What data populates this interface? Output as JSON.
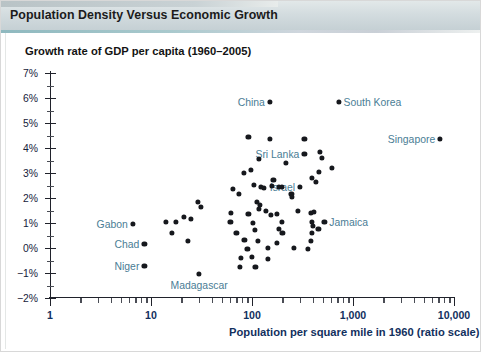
{
  "banner": {
    "title": "Population Density Versus Economic Growth"
  },
  "chart_data": {
    "type": "scatter",
    "title": "Population Density Versus Economic Growth",
    "xlabel": "Population per square mile in 1960 (ratio scale)",
    "ylabel": "Growth rate of GDP per capita (1960–2005)",
    "xscale": "log",
    "xlim": [
      1,
      10000
    ],
    "ylim": [
      -2,
      7
    ],
    "grid": false,
    "legend": null,
    "xticks": [
      {
        "value": 1,
        "label": "1"
      },
      {
        "value": 10,
        "label": "10"
      },
      {
        "value": 100,
        "label": "100"
      },
      {
        "value": 1000,
        "label": "1,000"
      },
      {
        "value": 10000,
        "label": "10,000"
      }
    ],
    "yticks": [
      {
        "value": 7,
        "label": "7%"
      },
      {
        "value": 6,
        "label": "6%"
      },
      {
        "value": 5,
        "label": "5%"
      },
      {
        "value": 4,
        "label": "4%"
      },
      {
        "value": 3,
        "label": "3%"
      },
      {
        "value": 2,
        "label": "2%"
      },
      {
        "value": 1,
        "label": "1%"
      },
      {
        "value": 0,
        "label": "0%"
      },
      {
        "value": -1,
        "label": "−1%"
      },
      {
        "value": -2,
        "label": "−2%"
      }
    ],
    "yminor": [
      6.5,
      5.5,
      4.5,
      3.5,
      2.5,
      1.5,
      0.5,
      -0.5,
      -1.5
    ],
    "points": [
      {
        "x": 150,
        "y": 5.85,
        "label": "China",
        "label_side": "left"
      },
      {
        "x": 720,
        "y": 5.85,
        "label": "South Korea",
        "label_side": "right"
      },
      {
        "x": 7300,
        "y": 4.35,
        "label": "Singapore",
        "label_side": "left"
      },
      {
        "x": 330,
        "y": 3.75,
        "label": "Sri Lanka",
        "label_side": "left"
      },
      {
        "x": 300,
        "y": 2.45,
        "label": "Israel",
        "label_side": "left"
      },
      {
        "x": 520,
        "y": 1.05,
        "label": "Jamaica",
        "label_side": "right"
      },
      {
        "x": 6.6,
        "y": 0.95,
        "label": "Gabon",
        "label_side": "left"
      },
      {
        "x": 8.6,
        "y": 0.17,
        "label": "Chad",
        "label_side": "left"
      },
      {
        "x": 8.6,
        "y": -0.72,
        "label": "Niger",
        "label_side": "left"
      },
      {
        "x": 30,
        "y": -1.05,
        "label": "Madagascar",
        "label_side": "below"
      },
      {
        "x": 92,
        "y": 4.45,
        "label": null
      },
      {
        "x": 150,
        "y": 4.35,
        "label": null
      },
      {
        "x": 330,
        "y": 4.35,
        "label": null
      },
      {
        "x": 470,
        "y": 3.85,
        "label": null
      },
      {
        "x": 490,
        "y": 3.62,
        "label": null
      },
      {
        "x": 118,
        "y": 3.55,
        "label": null
      },
      {
        "x": 218,
        "y": 3.42,
        "label": null
      },
      {
        "x": 620,
        "y": 3.22,
        "label": null
      },
      {
        "x": 98,
        "y": 3.12,
        "label": null
      },
      {
        "x": 83,
        "y": 3.02,
        "label": null
      },
      {
        "x": 460,
        "y": 3.05,
        "label": null
      },
      {
        "x": 390,
        "y": 2.82,
        "label": null
      },
      {
        "x": 163,
        "y": 2.72,
        "label": null
      },
      {
        "x": 430,
        "y": 2.65,
        "label": null
      },
      {
        "x": 105,
        "y": 2.52,
        "label": null
      },
      {
        "x": 122,
        "y": 2.45,
        "label": null
      },
      {
        "x": 132,
        "y": 2.42,
        "label": null
      },
      {
        "x": 158,
        "y": 2.48,
        "label": null
      },
      {
        "x": 186,
        "y": 2.45,
        "label": null
      },
      {
        "x": 196,
        "y": 2.45,
        "label": null
      },
      {
        "x": 65,
        "y": 2.35,
        "label": null
      },
      {
        "x": 74,
        "y": 2.18,
        "label": null
      },
      {
        "x": 246,
        "y": 2.18,
        "label": null
      },
      {
        "x": 250,
        "y": 2.05,
        "label": null
      },
      {
        "x": 29,
        "y": 1.85,
        "label": null
      },
      {
        "x": 31,
        "y": 1.65,
        "label": null
      },
      {
        "x": 112,
        "y": 1.85,
        "label": null
      },
      {
        "x": 120,
        "y": 1.72,
        "label": null
      },
      {
        "x": 116,
        "y": 1.58,
        "label": null
      },
      {
        "x": 138,
        "y": 1.48,
        "label": null
      },
      {
        "x": 62,
        "y": 1.42,
        "label": null
      },
      {
        "x": 92,
        "y": 1.35,
        "label": null
      },
      {
        "x": 154,
        "y": 1.32,
        "label": null
      },
      {
        "x": 176,
        "y": 1.35,
        "label": null
      },
      {
        "x": 286,
        "y": 1.48,
        "label": null
      },
      {
        "x": 380,
        "y": 1.42,
        "label": null
      },
      {
        "x": 410,
        "y": 1.45,
        "label": null
      },
      {
        "x": 14,
        "y": 1.05,
        "label": null
      },
      {
        "x": 17.5,
        "y": 1.05,
        "label": null
      },
      {
        "x": 21,
        "y": 1.25,
        "label": null
      },
      {
        "x": 25,
        "y": 1.15,
        "label": null
      },
      {
        "x": 61,
        "y": 1.05,
        "label": null
      },
      {
        "x": 103,
        "y": 1.02,
        "label": null
      },
      {
        "x": 196,
        "y": 1.05,
        "label": null
      },
      {
        "x": 392,
        "y": 1.05,
        "label": null
      },
      {
        "x": 400,
        "y": 0.88,
        "label": null
      },
      {
        "x": 455,
        "y": 0.78,
        "label": null
      },
      {
        "x": 16,
        "y": 0.62,
        "label": null
      },
      {
        "x": 70,
        "y": 0.62,
        "label": null
      },
      {
        "x": 107,
        "y": 0.72,
        "label": null
      },
      {
        "x": 186,
        "y": 0.78,
        "label": null
      },
      {
        "x": 200,
        "y": 0.62,
        "label": null
      },
      {
        "x": 390,
        "y": 0.62,
        "label": null
      },
      {
        "x": 23,
        "y": 0.28,
        "label": null
      },
      {
        "x": 84,
        "y": 0.32,
        "label": null
      },
      {
        "x": 115,
        "y": 0.28,
        "label": null
      },
      {
        "x": 175,
        "y": 0.22,
        "label": null
      },
      {
        "x": 380,
        "y": 0.28,
        "label": null
      },
      {
        "x": 90,
        "y": -0.05,
        "label": null
      },
      {
        "x": 144,
        "y": 0.02,
        "label": null
      },
      {
        "x": 262,
        "y": 0.02,
        "label": null
      },
      {
        "x": 355,
        "y": -0.05,
        "label": null
      },
      {
        "x": 78,
        "y": -0.38,
        "label": null
      },
      {
        "x": 100,
        "y": -0.35,
        "label": null
      },
      {
        "x": 145,
        "y": -0.42,
        "label": null
      },
      {
        "x": 76,
        "y": -0.75,
        "label": null
      },
      {
        "x": 108,
        "y": -0.75,
        "label": null
      }
    ]
  }
}
